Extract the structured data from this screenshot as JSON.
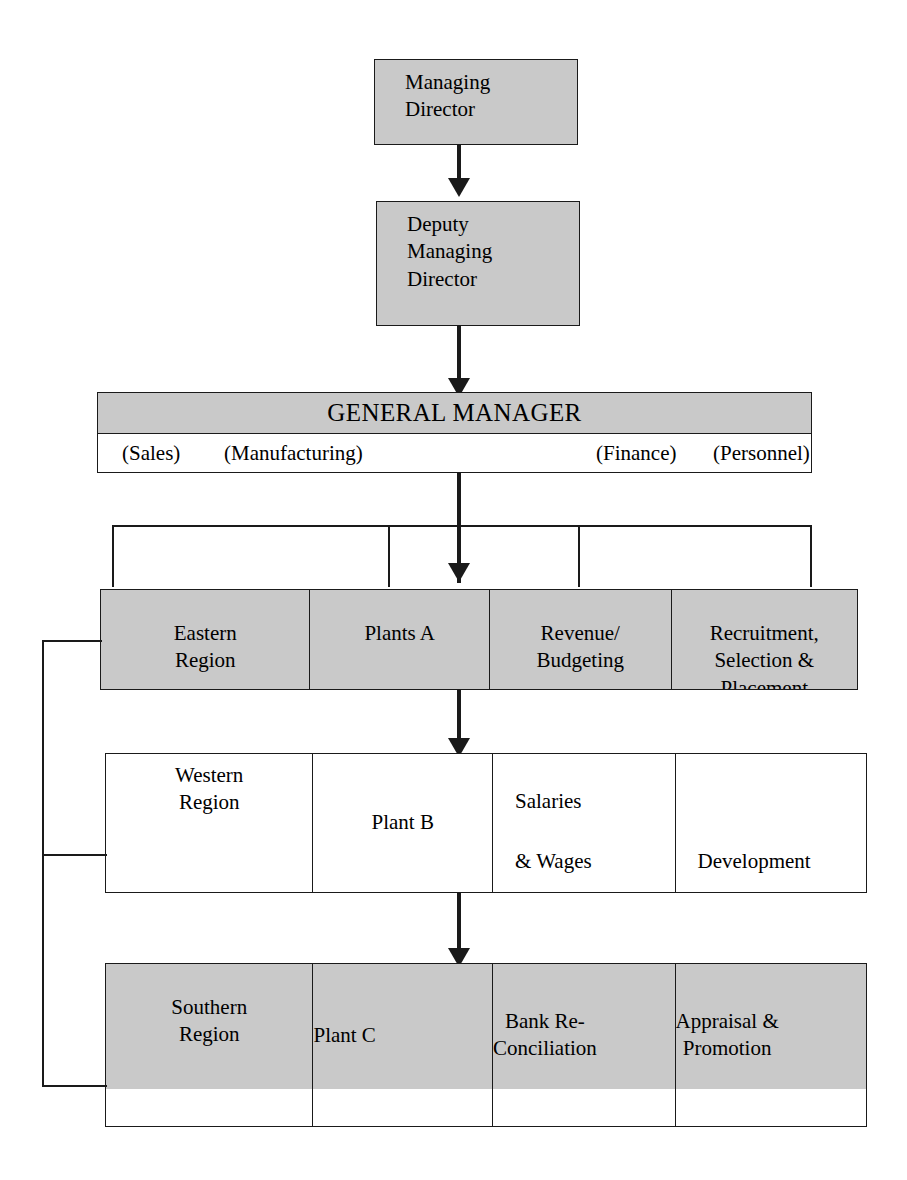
{
  "colors": {
    "shaded_fill": "#c9c9c9",
    "plain_fill": "#ffffff",
    "line": "#1a1a1a"
  },
  "top": {
    "managing_director": "Managing\nDirector",
    "deputy_managing_director": "Deputy\nManaging\nDirector"
  },
  "general_manager": {
    "title": "GENERAL MANAGER",
    "functions": [
      {
        "label": "(Sales)"
      },
      {
        "label": "(Manufacturing)"
      },
      {
        "label": "(Finance)"
      },
      {
        "label": "(Personnel)"
      }
    ]
  },
  "tiers": [
    {
      "name": "tier-1",
      "shaded": true,
      "cells": [
        {
          "text": "Eastern\nRegion"
        },
        {
          "text": "Plants A"
        },
        {
          "text": "Revenue/\nBudgeting"
        },
        {
          "text": "Recruitment,\nSelection &\nPlacement"
        }
      ]
    },
    {
      "name": "tier-2",
      "shaded": false,
      "cells": [
        {
          "text": "Western\nRegion"
        },
        {
          "text": "Plant B"
        },
        {
          "text": "Salaries"
        },
        {
          "text": "& Wages"
        },
        {
          "text": "Development"
        }
      ]
    },
    {
      "name": "tier-3",
      "shaded": true,
      "cells": [
        {
          "text": "Southern\nRegion"
        },
        {
          "text": "Plant C"
        },
        {
          "text": "Bank Re-\nConciliation"
        },
        {
          "text": "Appraisal &\nPromotion"
        }
      ]
    }
  ]
}
